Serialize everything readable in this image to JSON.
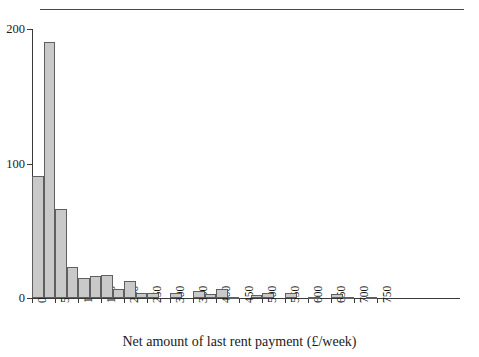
{
  "figure": {
    "top_rule": true,
    "background": "#ffffff",
    "bar_fill": "#c9c9c9",
    "bar_edge": "#5f5f5f",
    "axis_color": "#3a3a3a"
  },
  "chart_data": {
    "type": "bar",
    "title": "",
    "subtitle": "",
    "xlabel": "Net amount of last rent payment (£/week)",
    "ylabel": "",
    "grid": false,
    "legend": null,
    "bin_width": 25,
    "xlim": [
      0,
      760
    ],
    "ylim": [
      0,
      200
    ],
    "yticks": [
      0,
      100,
      200
    ],
    "ytick_labels": [
      "0",
      "100",
      "200"
    ],
    "xticks": [
      0,
      50,
      100,
      150,
      200,
      250,
      300,
      350,
      400,
      450,
      500,
      550,
      600,
      650,
      700,
      750
    ],
    "xtick_labels": [
      "0",
      "50",
      "100",
      "150",
      "200",
      "250",
      "300",
      "350",
      "400",
      "450",
      "500",
      "550",
      "600",
      "650",
      "700",
      "750"
    ],
    "bin_starts": [
      0,
      25,
      50,
      75,
      100,
      125,
      150,
      175,
      200,
      225,
      250,
      275,
      300,
      325,
      350,
      375,
      400,
      425,
      450,
      475,
      500,
      525,
      550,
      575,
      600,
      625,
      650,
      675,
      700,
      725
    ],
    "categories": [
      "0-25",
      "25-50",
      "50-75",
      "75-100",
      "100-125",
      "125-150",
      "150-175",
      "175-200",
      "200-225",
      "225-250",
      "250-275",
      "275-300",
      "300-325",
      "325-350",
      "350-375",
      "375-400",
      "400-425",
      "425-450",
      "450-475",
      "475-500",
      "500-525",
      "525-550",
      "550-575",
      "575-600",
      "600-625",
      "625-650",
      "650-675",
      "675-700",
      "700-725",
      "725-750"
    ],
    "values": [
      91,
      190,
      66,
      23,
      15,
      16,
      17,
      7,
      13,
      4,
      4,
      0,
      4,
      0,
      5,
      3,
      7,
      1,
      0,
      2,
      4,
      0,
      4,
      0,
      1,
      0,
      3,
      1,
      0,
      1
    ]
  }
}
